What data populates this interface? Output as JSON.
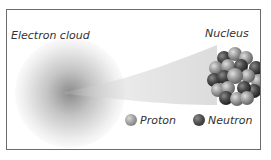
{
  "diagram": {
    "title_left": "Electron cloud",
    "title_right": "Nucleus",
    "legend": [
      {
        "label": "Proton",
        "color": "#9a9a9a"
      },
      {
        "label": "Neutron",
        "color": "#4a4a4a"
      }
    ]
  }
}
